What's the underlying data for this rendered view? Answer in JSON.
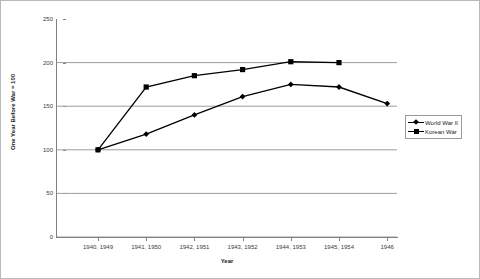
{
  "chart_data": {
    "type": "line",
    "title": "",
    "xlabel": "Year",
    "ylabel": "One Year Before War = 100",
    "categories": [
      "1940, 1949",
      "1941, 1950",
      "1942, 1951",
      "1943, 1952",
      "1944, 1953",
      "1945, 1954",
      "1946"
    ],
    "series": [
      {
        "name": "World War II",
        "marker": "diamond",
        "color": "#000000",
        "values": [
          100,
          118,
          140,
          161,
          175,
          172,
          153
        ]
      },
      {
        "name": "Korean War",
        "marker": "square",
        "color": "#000000",
        "values": [
          100,
          172,
          185,
          192,
          201,
          200,
          null
        ]
      }
    ],
    "ylim": [
      0,
      250
    ],
    "yticks": [
      0,
      50,
      100,
      150,
      200,
      250
    ],
    "ytick_labels": [
      "0",
      "50",
      "100",
      "150",
      "200",
      "250"
    ],
    "grid": "horizontal",
    "legend_position": "right"
  }
}
